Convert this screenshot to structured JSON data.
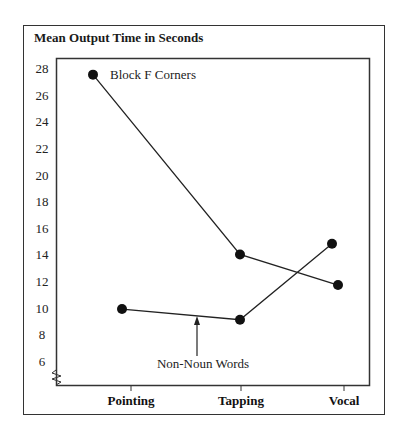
{
  "chart_data": {
    "type": "line",
    "title": "Mean Output Time in Seconds",
    "xlabel": "",
    "ylabel": "Mean Output Time in Seconds",
    "categories": [
      "Pointing",
      "Tapping",
      "Vocal"
    ],
    "yticks": [
      6,
      8,
      10,
      12,
      14,
      16,
      18,
      20,
      22,
      24,
      26,
      28
    ],
    "ylim": [
      4.4,
      29
    ],
    "axis_break": true,
    "grid": false,
    "legend": "none (direct labels)",
    "series": [
      {
        "name": "Block F Corners",
        "values": [
          27.5,
          14.0,
          11.7
        ]
      },
      {
        "name": "Non-Noun Words",
        "values": [
          9.9,
          9.1,
          14.8
        ]
      }
    ],
    "annotations": [
      {
        "text": "Block F Corners",
        "target": "Block F Corners series, Pointing point"
      },
      {
        "text": "Non-Noun Words",
        "target": "arrow pointing to Non-Noun Words line segment"
      }
    ]
  }
}
